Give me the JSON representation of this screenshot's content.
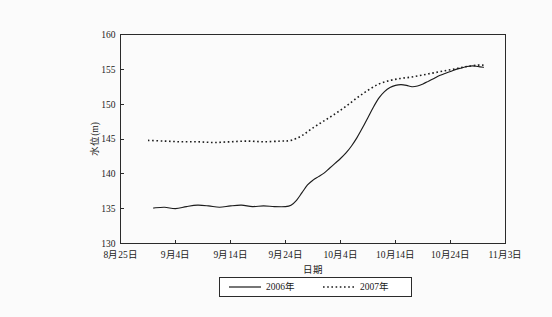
{
  "chart_data": {
    "type": "line",
    "title": "",
    "xlabel": "日期",
    "ylabel": "水位(m)",
    "ylim": [
      130,
      160
    ],
    "yticks": [
      130,
      135,
      140,
      145,
      150,
      155,
      160
    ],
    "ytick_labels": [
      "130",
      "135",
      "140",
      "145",
      "150",
      "155",
      "160"
    ],
    "xtick_labels": [
      "8月25日",
      "9月4日",
      "9月14日",
      "9月24日",
      "10月4日",
      "10月14日",
      "10月24日",
      "11月3日"
    ],
    "xlim_days": [
      0,
      70
    ],
    "xtick_days": [
      0,
      10,
      20,
      30,
      40,
      50,
      60,
      70
    ],
    "grid": false,
    "legend_position": "below-axes-center",
    "series": [
      {
        "name": "2006年",
        "style": "solid",
        "color": "#1c1c1c",
        "x": [
          6,
          8,
          10,
          12,
          14,
          16,
          18,
          20,
          22,
          24,
          26,
          28,
          30,
          31,
          32,
          33,
          34,
          35,
          36,
          37,
          38,
          39,
          40,
          41,
          42,
          43,
          44,
          45,
          46,
          47,
          48,
          49,
          50,
          51,
          52,
          53,
          54,
          55,
          56,
          57,
          58,
          59,
          60,
          61,
          62,
          63,
          64,
          65,
          66
        ],
        "y": [
          135.1,
          135.2,
          135.0,
          135.3,
          135.5,
          135.4,
          135.2,
          135.4,
          135.5,
          135.3,
          135.4,
          135.3,
          135.3,
          135.5,
          136.2,
          137.3,
          138.4,
          139.1,
          139.6,
          140.1,
          140.8,
          141.5,
          142.2,
          143.0,
          144.0,
          145.2,
          146.6,
          148.1,
          149.6,
          150.9,
          151.8,
          152.4,
          152.7,
          152.8,
          152.7,
          152.5,
          152.6,
          152.9,
          153.3,
          153.7,
          154.1,
          154.4,
          154.7,
          155.0,
          155.2,
          155.4,
          155.5,
          155.4,
          155.3
        ]
      },
      {
        "name": "2007年",
        "style": "dotted",
        "color": "#1c1c1c",
        "x": [
          5,
          8,
          11,
          14,
          17,
          20,
          23,
          26,
          29,
          31,
          33,
          35,
          37,
          39,
          41,
          43,
          45,
          47,
          49,
          51,
          53,
          55,
          57,
          59,
          61,
          63,
          65,
          66
        ],
        "y": [
          144.8,
          144.7,
          144.6,
          144.6,
          144.5,
          144.6,
          144.7,
          144.6,
          144.7,
          144.8,
          145.5,
          146.6,
          147.6,
          148.6,
          149.7,
          150.9,
          152.0,
          152.9,
          153.4,
          153.7,
          153.9,
          154.2,
          154.5,
          154.8,
          155.1,
          155.4,
          155.6,
          155.6
        ]
      }
    ]
  },
  "legend": {
    "entries": [
      {
        "label": "2006年",
        "style": "solid"
      },
      {
        "label": "2007年",
        "style": "dotted"
      }
    ]
  }
}
